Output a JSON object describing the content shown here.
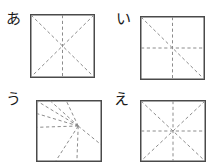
{
  "figure": {
    "title": "",
    "background_color": "#ffffff",
    "width": 218,
    "height": 168,
    "square_stroke_color": "#4a4a4a",
    "crease_stroke_color": "#8c8c8c",
    "label_color": "#1a1a1a"
  },
  "panels": [
    {
      "id": "a",
      "label": "あ",
      "label_x": 6,
      "label_y": 14,
      "square": {
        "x": 30,
        "y": 14,
        "w": 65,
        "h": 64
      },
      "crease_description": "two full diagonals and one vertical centerline; no horizontal centerline",
      "crease_count": 3,
      "creases": [
        {
          "name": "diagonal-tl-br",
          "x1": 0,
          "y1": 0,
          "x2": 1,
          "y2": 1
        },
        {
          "name": "diagonal-tr-bl",
          "x1": 1,
          "y1": 0,
          "x2": 0,
          "y2": 1
        },
        {
          "name": "vertical-center",
          "x1": 0.5,
          "y1": 0,
          "x2": 0.5,
          "y2": 1
        }
      ]
    },
    {
      "id": "i",
      "label": "い",
      "label_x": 116,
      "label_y": 14,
      "square": {
        "x": 140,
        "y": 16,
        "w": 65,
        "h": 64
      },
      "crease_description": "one diagonal from top-left to bottom-right, plus vertical and horizontal centerlines",
      "crease_count": 3,
      "creases": [
        {
          "name": "diagonal-tl-br",
          "x1": 0,
          "y1": 0,
          "x2": 1,
          "y2": 1
        },
        {
          "name": "vertical-center",
          "x1": 0.5,
          "y1": 0,
          "x2": 0.5,
          "y2": 1
        },
        {
          "name": "horizontal-center",
          "x1": 0,
          "y1": 0.5,
          "x2": 1,
          "y2": 0.5
        }
      ]
    },
    {
      "id": "u",
      "label": "う",
      "label_x": 6,
      "label_y": 94,
      "square": {
        "x": 36,
        "y": 100,
        "w": 66,
        "h": 62
      },
      "crease_description": "asymmetric fan of eight rays radiating from an off-center hub located right of center and slightly above the middle",
      "crease_count": 8,
      "hub": {
        "x": 0.64,
        "y": 0.42
      },
      "creases": [
        {
          "name": "ray-to-top-left-corner",
          "x2": 0.0,
          "y2": 0.0
        },
        {
          "name": "ray-to-top-edge-left",
          "x2": 0.22,
          "y2": 0.0
        },
        {
          "name": "ray-to-top-edge-right",
          "x2": 0.46,
          "y2": 0.0
        },
        {
          "name": "ray-to-left-edge-upper",
          "x2": 0.0,
          "y2": 0.22
        },
        {
          "name": "ray-to-left-edge-lower",
          "x2": 0.0,
          "y2": 0.44
        },
        {
          "name": "ray-to-bottom-edge-left",
          "x2": 0.3,
          "y2": 1.0
        },
        {
          "name": "ray-to-bottom-edge-right",
          "x2": 0.62,
          "y2": 1.0
        },
        {
          "name": "ray-to-right-edge",
          "x2": 1.0,
          "y2": 0.72
        }
      ]
    },
    {
      "id": "e",
      "label": "え",
      "label_x": 114,
      "label_y": 94,
      "square": {
        "x": 140,
        "y": 100,
        "w": 66,
        "h": 62
      },
      "crease_description": "full eight-ray star: both diagonals plus vertical and horizontal centerlines",
      "crease_count": 4,
      "creases": [
        {
          "name": "diagonal-tl-br",
          "x1": 0,
          "y1": 0,
          "x2": 1,
          "y2": 1
        },
        {
          "name": "diagonal-tr-bl",
          "x1": 1,
          "y1": 0,
          "x2": 0,
          "y2": 1
        },
        {
          "name": "vertical-center",
          "x1": 0.5,
          "y1": 0,
          "x2": 0.5,
          "y2": 1
        },
        {
          "name": "horizontal-center",
          "x1": 0,
          "y1": 0.5,
          "x2": 1,
          "y2": 0.5
        }
      ]
    }
  ]
}
